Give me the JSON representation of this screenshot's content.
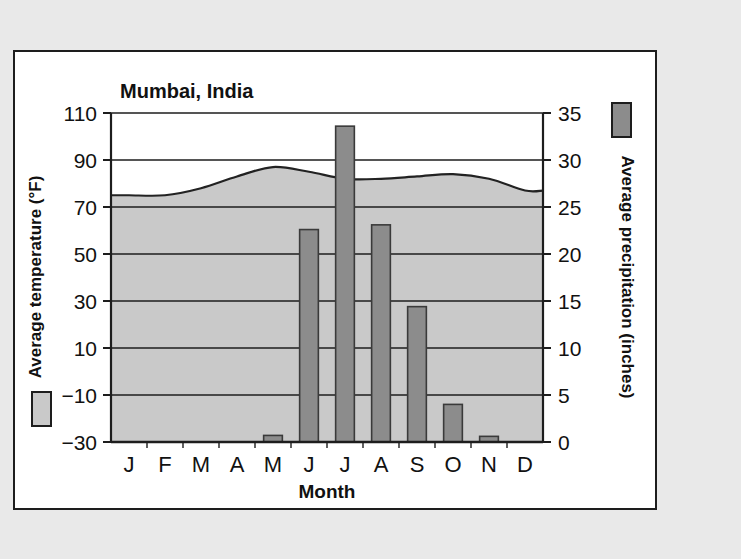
{
  "card": {
    "background_color": "#ffffff",
    "border_color": "#1d1d1d",
    "page_background": "#e9e9e9"
  },
  "chart_data": {
    "type": "area",
    "title": "Mumbai, India",
    "xlabel": "Month",
    "categories": [
      "J",
      "F",
      "M",
      "A",
      "M",
      "J",
      "J",
      "A",
      "S",
      "O",
      "N",
      "D"
    ],
    "month_names": [
      "January",
      "February",
      "March",
      "April",
      "May",
      "June",
      "July",
      "August",
      "September",
      "October",
      "November",
      "December"
    ],
    "grid": true,
    "legend_position": "axis-labels",
    "left_axis": {
      "label": "Average temperature (°F)",
      "ticks": [
        "110",
        "90",
        "70",
        "50",
        "30",
        "10",
        "−10",
        "−30"
      ],
      "tick_values": [
        110,
        90,
        70,
        50,
        30,
        10,
        -10,
        -30
      ],
      "ylim": [
        -30,
        110
      ],
      "swatch_color": "#c9c9c9"
    },
    "right_axis": {
      "label": "Average precipitation (inches)",
      "ticks": [
        "35",
        "30",
        "25",
        "20",
        "15",
        "10",
        "5",
        "0"
      ],
      "tick_values": [
        35,
        30,
        25,
        20,
        15,
        10,
        5,
        0
      ],
      "ylim": [
        0,
        35
      ],
      "swatch_color": "#8c8c8c"
    },
    "series": [
      {
        "name": "Average temperature (°F)",
        "kind": "area",
        "axis": "left",
        "unit": "°F",
        "color": "#c9c9c9",
        "line_color": "#222222",
        "values": [
          75,
          75,
          78,
          83,
          87,
          85,
          82,
          82,
          83,
          84,
          82,
          77
        ]
      },
      {
        "name": "Average precipitation (inches)",
        "kind": "bar",
        "axis": "right",
        "unit": "inches",
        "color": "#8c8c8c",
        "line_color": "#3a3a3a",
        "values": [
          0,
          0,
          0,
          0,
          0.7,
          22.6,
          33.6,
          23.1,
          14.4,
          4.0,
          0.6,
          0
        ]
      }
    ]
  }
}
